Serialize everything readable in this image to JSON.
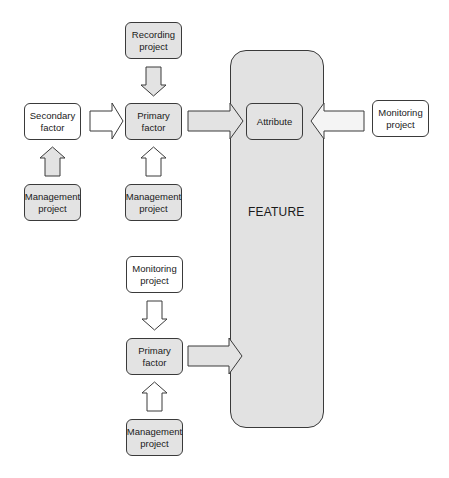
{
  "diagram": {
    "feature": {
      "label": "FEATURE",
      "fill": "#e2e2e2"
    },
    "nodes": {
      "recording_project": {
        "label": "Recording project",
        "fill": "#e3e3e3"
      },
      "secondary_factor": {
        "label": "Secondary factor",
        "fill": "#ffffff"
      },
      "primary_factor_top": {
        "label": "Primary factor",
        "fill": "#e3e3e3"
      },
      "attribute": {
        "label": "Attribute",
        "fill": "#e3e3e3"
      },
      "monitoring_project_right": {
        "label": "Monitoring project",
        "fill": "#ffffff"
      },
      "management_project_left": {
        "label": "Management project",
        "fill": "#e3e3e3"
      },
      "management_project_top": {
        "label": "Management project",
        "fill": "#e3e3e3"
      },
      "monitoring_project_bottom": {
        "label": "Monitoring project",
        "fill": "#ffffff"
      },
      "primary_factor_bottom": {
        "label": "Primary factor",
        "fill": "#e3e3e3"
      },
      "management_project_bottom": {
        "label": "Management project",
        "fill": "#e3e3e3"
      }
    },
    "edges": [
      {
        "from": "Recording project",
        "to": "Primary factor (top)",
        "direction": "down",
        "fill": "#e3e3e3"
      },
      {
        "from": "Secondary factor",
        "to": "Primary factor (top)",
        "direction": "right",
        "fill": "#ffffff"
      },
      {
        "from": "Primary factor (top)",
        "to": "Attribute",
        "direction": "right",
        "fill": "#e3e3e3"
      },
      {
        "from": "Monitoring project (right)",
        "to": "Attribute",
        "direction": "left",
        "fill": "#ffffff"
      },
      {
        "from": "Management project (left)",
        "to": "Secondary factor",
        "direction": "up",
        "fill": "#e3e3e3"
      },
      {
        "from": "Management project (top)",
        "to": "Primary factor (top)",
        "direction": "up",
        "fill": "#ffffff"
      },
      {
        "from": "Monitoring project (bottom)",
        "to": "Primary factor (bottom)",
        "direction": "down",
        "fill": "#ffffff"
      },
      {
        "from": "Primary factor (bottom)",
        "to": "FEATURE",
        "direction": "right",
        "fill": "#e3e3e3"
      },
      {
        "from": "Management project (bottom)",
        "to": "Primary factor (bottom)",
        "direction": "up",
        "fill": "#ffffff"
      }
    ]
  }
}
